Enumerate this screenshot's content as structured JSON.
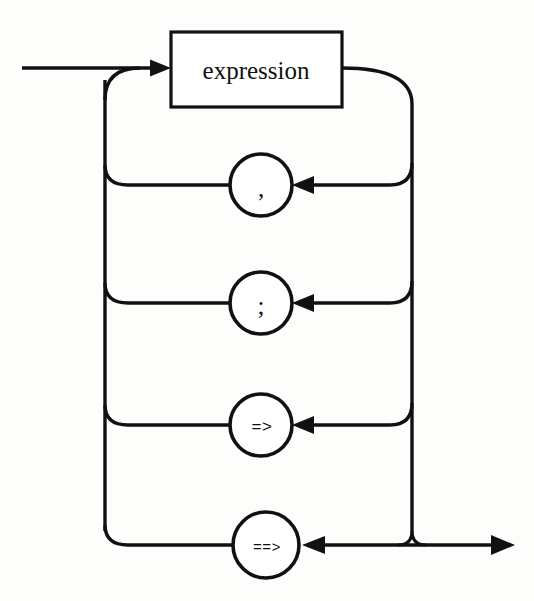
{
  "diagram": {
    "kind": "railroad-syntax-diagram",
    "background_color": "#fdfdfb",
    "line_color": "#111111",
    "node_fill": "#ffffff",
    "entry": {
      "name": "entry-line",
      "label": ""
    },
    "exit": {
      "name": "exit-line",
      "label": ""
    },
    "box_nodes": [
      {
        "id": "expression",
        "label": "expression",
        "shape": "rectangle",
        "x": 171,
        "y": 32,
        "width": 171,
        "height": 75
      }
    ],
    "circle_nodes": [
      {
        "id": "comma",
        "label": ",",
        "label_style": "punct",
        "shape": "circle",
        "cx": 261,
        "cy": 185,
        "r": 31,
        "row": 1
      },
      {
        "id": "semicolon",
        "label": ";",
        "label_style": "punct",
        "shape": "circle",
        "cx": 261,
        "cy": 303,
        "r": 31,
        "row": 2
      },
      {
        "id": "arrow-single",
        "label": "=>",
        "label_style": "arrowtok",
        "shape": "circle",
        "cx": 261,
        "cy": 425,
        "r": 31,
        "row": 3
      },
      {
        "id": "arrow-double",
        "label": "==>",
        "label_style": "arrowtok-wide",
        "shape": "circle",
        "cx": 266,
        "cy": 545,
        "r": 33,
        "row": 4
      }
    ],
    "rails": {
      "left_rail_x": 105,
      "right_rail_x": 412,
      "entry_y": 68,
      "exit_y": 545,
      "row_y": [
        185,
        303,
        425,
        545
      ]
    }
  }
}
